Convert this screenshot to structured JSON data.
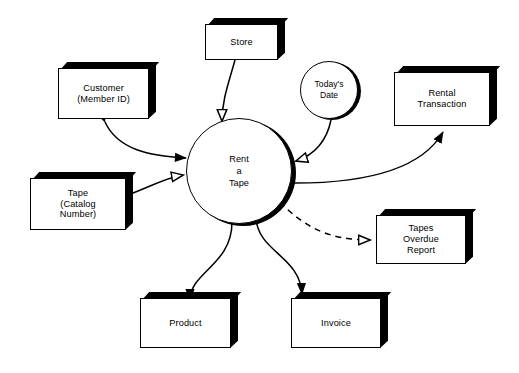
{
  "diagram": {
    "background_color": "#ffffff",
    "line_color": "#000000",
    "process": {
      "name": "rent-a-tape-process",
      "label": "Rent\na\nTape",
      "shape": "circle-with-shadow"
    },
    "entities": [
      {
        "id": "store",
        "label": "Store",
        "shape": "box-3d"
      },
      {
        "id": "customer",
        "label": "Customer\n(Member ID)",
        "shape": "box-3d"
      },
      {
        "id": "todays-date",
        "label": "Today's\nDate",
        "shape": "circle-small"
      },
      {
        "id": "rental-transaction",
        "label": "Rental\nTransaction",
        "shape": "box-3d"
      },
      {
        "id": "tape",
        "label": "Tape\n(Catalog\nNumber)",
        "shape": "box-3d"
      },
      {
        "id": "tapes-overdue-report",
        "label": "Tapes\nOverdue\nReport",
        "shape": "box-3d"
      },
      {
        "id": "product",
        "label": "Product",
        "shape": "box-3d"
      },
      {
        "id": "invoice",
        "label": "Invoice",
        "shape": "box-3d"
      }
    ],
    "flows": [
      {
        "id": "store-to-process",
        "from": "store",
        "to": "rent-a-tape",
        "style": "solid",
        "head": "hollow",
        "direction": "one-way"
      },
      {
        "id": "customer-process",
        "from": "customer",
        "to": "rent-a-tape",
        "style": "solid",
        "head": "filled",
        "direction": "two-way"
      },
      {
        "id": "tape-to-process",
        "from": "tape",
        "to": "rent-a-tape",
        "style": "solid",
        "head": "hollow",
        "direction": "one-way"
      },
      {
        "id": "todays-date-to-process",
        "from": "todays-date",
        "to": "rent-a-tape",
        "style": "solid",
        "head": "hollow",
        "direction": "one-way"
      },
      {
        "id": "process-to-rental-transaction",
        "from": "rent-a-tape",
        "to": "rental-transaction",
        "style": "solid",
        "head": "filled",
        "direction": "one-way"
      },
      {
        "id": "process-to-overdue-report",
        "from": "rent-a-tape",
        "to": "tapes-overdue-report",
        "style": "dashed",
        "head": "hollow",
        "direction": "one-way"
      },
      {
        "id": "product-process",
        "from": "product",
        "to": "rent-a-tape",
        "style": "solid",
        "head": "filled",
        "direction": "two-way"
      },
      {
        "id": "process-to-invoice",
        "from": "rent-a-tape",
        "to": "invoice",
        "style": "solid",
        "head": "filled",
        "direction": "one-way"
      }
    ]
  }
}
